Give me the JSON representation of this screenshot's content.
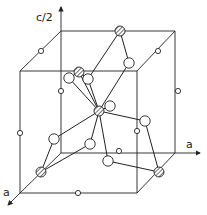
{
  "diagram": {
    "type": "crystal-structure-unit-cell",
    "labels": {
      "c_axis": "c/2",
      "a_axis_right": "a",
      "a_axis_front": "a"
    },
    "colors": {
      "line": "#222222",
      "background": "#ffffff",
      "atom_fill": "#ffffff",
      "hatch": "#333333"
    },
    "cell_corners": {
      "back_top_left": [
        61,
        31
      ],
      "back_top_right": [
        175,
        31
      ],
      "front_top_left": [
        20,
        71
      ],
      "front_top_right": [
        137,
        71
      ],
      "back_bottom_left": [
        61,
        153
      ],
      "back_bottom_right": [
        175,
        153
      ],
      "front_bottom_left": [
        20,
        193
      ],
      "front_bottom_right": [
        137,
        193
      ]
    },
    "hatched_atoms": [
      {
        "x": 120,
        "y": 31
      },
      {
        "x": 79,
        "y": 72
      },
      {
        "x": 99,
        "y": 111
      },
      {
        "x": 41,
        "y": 172
      },
      {
        "x": 159,
        "y": 172
      }
    ],
    "large_open_atoms": [
      {
        "x": 129,
        "y": 63
      },
      {
        "x": 69,
        "y": 78
      },
      {
        "x": 88,
        "y": 79
      },
      {
        "x": 110,
        "y": 106
      },
      {
        "x": 145,
        "y": 121
      },
      {
        "x": 54,
        "y": 139
      },
      {
        "x": 90,
        "y": 144
      },
      {
        "x": 108,
        "y": 161
      }
    ],
    "small_open_atoms": [
      {
        "x": 41,
        "y": 51
      },
      {
        "x": 158,
        "y": 51
      },
      {
        "x": 61,
        "y": 91
      },
      {
        "x": 178,
        "y": 91
      },
      {
        "x": 20,
        "y": 133
      },
      {
        "x": 137,
        "y": 131
      },
      {
        "x": 119,
        "y": 151
      },
      {
        "x": 78,
        "y": 193
      }
    ]
  }
}
